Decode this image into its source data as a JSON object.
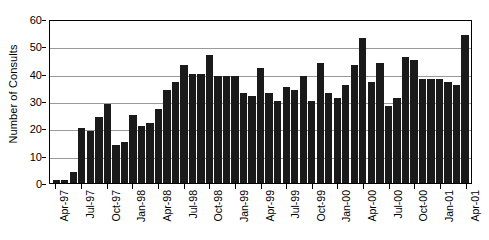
{
  "chart_data": {
    "type": "bar",
    "title": "",
    "xlabel": "",
    "ylabel": "Number of Consults",
    "ylim": [
      0,
      60
    ],
    "yticks": [
      0,
      10,
      20,
      30,
      40,
      50,
      60
    ],
    "grid": true,
    "legend": "none",
    "bar_color": "#1a1a1a",
    "axis_color": "#000000",
    "gridline_color": "#9a9a9a",
    "categories": [
      "Apr-97",
      "May-97",
      "Jun-97",
      "Jul-97",
      "Aug-97",
      "Sep-97",
      "Oct-97",
      "Nov-97",
      "Dec-97",
      "Jan-98",
      "Feb-98",
      "Mar-98",
      "Apr-98",
      "May-98",
      "Jun-98",
      "Jul-98",
      "Aug-98",
      "Sep-98",
      "Oct-98",
      "Nov-98",
      "Dec-98",
      "Jan-99",
      "Feb-99",
      "Mar-99",
      "Apr-99",
      "May-99",
      "Jun-99",
      "Jul-99",
      "Aug-99",
      "Sep-99",
      "Oct-99",
      "Nov-99",
      "Dec-99",
      "Jan-00",
      "Feb-00",
      "Mar-00",
      "Apr-00",
      "May-00",
      "Jun-00",
      "Jul-00",
      "Aug-00",
      "Sep-00",
      "Oct-00",
      "Nov-00",
      "Dec-00",
      "Jan-01",
      "Feb-01",
      "Mar-01",
      "Apr-01"
    ],
    "values": [
      1,
      1,
      4,
      20,
      19,
      24,
      29,
      14,
      15,
      25,
      21,
      22,
      27,
      34,
      37,
      43,
      40,
      40,
      47,
      39,
      39,
      39,
      33,
      32,
      42,
      33,
      30,
      35,
      34,
      39,
      30,
      44,
      33,
      31,
      36,
      43,
      53,
      37,
      44,
      28,
      31,
      46,
      45,
      38,
      38,
      38,
      37,
      36,
      54
    ],
    "tick_labels": [
      {
        "index": 0,
        "label": "Apr-97"
      },
      {
        "index": 3,
        "label": "Jul-97"
      },
      {
        "index": 6,
        "label": "Oct-97"
      },
      {
        "index": 9,
        "label": "Jan-98"
      },
      {
        "index": 12,
        "label": "Apr-98"
      },
      {
        "index": 15,
        "label": "Jul-98"
      },
      {
        "index": 18,
        "label": "Oct-98"
      },
      {
        "index": 21,
        "label": "Jan-99"
      },
      {
        "index": 24,
        "label": "Apr-99"
      },
      {
        "index": 27,
        "label": "Jul-99"
      },
      {
        "index": 30,
        "label": "Oct-99"
      },
      {
        "index": 33,
        "label": "Jan-00"
      },
      {
        "index": 36,
        "label": "Apr-00"
      },
      {
        "index": 39,
        "label": "Jul-00"
      },
      {
        "index": 42,
        "label": "Oct-00"
      },
      {
        "index": 45,
        "label": "Jan-01"
      },
      {
        "index": 48,
        "label": "Apr-01"
      }
    ]
  }
}
